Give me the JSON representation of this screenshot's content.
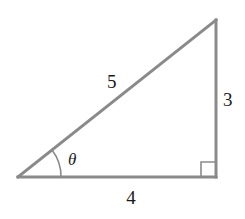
{
  "diagram": {
    "type": "right-triangle",
    "stroke_color": "#8a8a8a",
    "label_color": "#1a1a1a",
    "vertices": {
      "bottom_left": [
        17,
        177
      ],
      "bottom_right": [
        216,
        177
      ],
      "top_right": [
        216,
        20
      ]
    },
    "labels": {
      "hypotenuse": "5",
      "vertical_side": "3",
      "horizontal_side": "4",
      "angle": "θ"
    },
    "right_angle_marker": true
  }
}
